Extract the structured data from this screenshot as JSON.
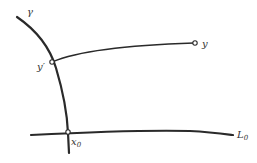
{
  "diagram": {
    "labels": {
      "gamma": "γ",
      "y_prime": "y′",
      "y": "y",
      "x0_base": "x",
      "x0_sub": "0",
      "L0_base": "L",
      "L0_sub": "0"
    },
    "elements": [
      {
        "id": "gamma-curve",
        "type": "curve",
        "label": "γ"
      },
      {
        "id": "path-yprime-to-y",
        "type": "curve",
        "from": "y′",
        "to": "y"
      },
      {
        "id": "line-L0",
        "type": "line",
        "label": "L0"
      },
      {
        "id": "point-y-prime",
        "type": "point",
        "label": "y′",
        "on": "γ"
      },
      {
        "id": "point-y",
        "type": "point",
        "label": "y"
      },
      {
        "id": "point-x0",
        "type": "point",
        "label": "x0",
        "on": [
          "γ",
          "L0"
        ]
      }
    ],
    "colors": {
      "stroke": "#2a2a2a",
      "background": "#ffffff"
    }
  }
}
